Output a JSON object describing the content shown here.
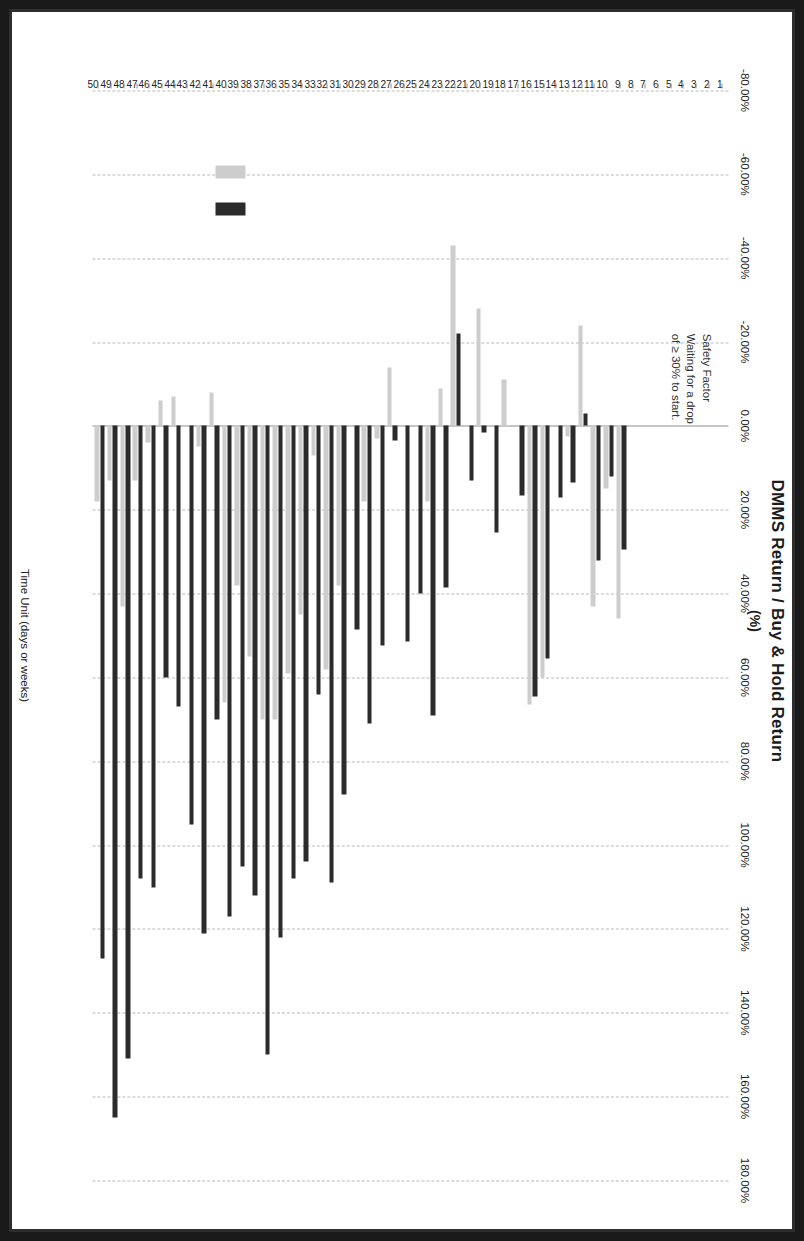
{
  "chart_data": {
    "type": "bar",
    "orientation": "horizontal",
    "title": "DMMS Return / Buy & Hold Return",
    "subtitle": "(%)",
    "xlabel": "Time Unit (days or weeks)",
    "ylabel": "",
    "value_axis_label": "DMMS Return / Buy & Hold Return (%)",
    "xlim": [
      -80,
      180
    ],
    "tick_step": 20,
    "grid": true,
    "tick_labels": [
      "-80.00%",
      "-60.00%",
      "-40.00%",
      "-20.00%",
      "0.00%",
      "20.00%",
      "40.00%",
      "60.00%",
      "80.00%",
      "100.00%",
      "120.00%",
      "140.00%",
      "160.00%",
      "180.00%"
    ],
    "tick_values": [
      -80,
      -60,
      -40,
      -20,
      0,
      20,
      40,
      60,
      80,
      100,
      120,
      140,
      160,
      180
    ],
    "categories": [
      "1",
      "2",
      "3",
      "4",
      "5",
      "6",
      "7",
      "8",
      "9",
      "10",
      "11",
      "12",
      "13",
      "14",
      "15",
      "16",
      "17",
      "18",
      "19",
      "20",
      "21",
      "22",
      "23",
      "24",
      "25",
      "26",
      "27",
      "28",
      "29",
      "30",
      "31",
      "32",
      "33",
      "34",
      "35",
      "36",
      "37",
      "38",
      "39",
      "40",
      "41",
      "42",
      "43",
      "44",
      "45",
      "46",
      "47",
      "48",
      "49",
      "50"
    ],
    "legend": {
      "position": "bottom-left",
      "entries": [
        "Buy & Hold Return",
        "DMMS Return"
      ]
    },
    "annotation": "Safety Factor\nWaiting for a drop\nof ≥ 30% to start.",
    "series": [
      {
        "name": "DMMS Return",
        "color": "#2b2b2b",
        "values": [
          0,
          0,
          0,
          0,
          0,
          0,
          0,
          0,
          29.5,
          12.0,
          32.0,
          -3.0,
          13.5,
          17.0,
          55.5,
          64.5,
          16.5,
          0,
          25.5,
          1.5,
          13.0,
          -22.0,
          38.5,
          69.0,
          40.0,
          51.5,
          3.5,
          52.5,
          71.0,
          48.5,
          88.0,
          109.0,
          64.0,
          104.0,
          108.0,
          122.0,
          150.0,
          112.0,
          105.0,
          117.0,
          70.0,
          121.0,
          95.0,
          67.0,
          60.0,
          110.0,
          108.0,
          151.0,
          165.0,
          127.0
        ]
      },
      {
        "name": "Buy & Hold Return",
        "color": "#cdcdcd",
        "values": [
          0,
          0,
          0,
          0,
          0,
          0,
          0,
          0,
          46.0,
          15.0,
          43.0,
          -24.0,
          2.5,
          0,
          60.0,
          66.5,
          0,
          -11.0,
          0,
          -28.0,
          0,
          -43.0,
          -9.0,
          18.0,
          0,
          0,
          -14.0,
          3.0,
          18.0,
          0,
          38.0,
          58.0,
          7.0,
          45.0,
          59.0,
          70.0,
          70.0,
          55.0,
          38.0,
          66.0,
          -8.0,
          5.0,
          0,
          -7.0,
          -6.0,
          4.0,
          13.0,
          43.0,
          13.0,
          18.0
        ]
      }
    ]
  },
  "header": {
    "title": "DMMS Return / Buy & Hold Return",
    "subtitle": "(%)"
  },
  "annotation": {
    "line1": "Safety Factor",
    "line2": "Waiting for a drop",
    "line3": "of ≥ 30% to start."
  },
  "axis": {
    "category_axis_title": "Time Unit (days or weeks)"
  }
}
